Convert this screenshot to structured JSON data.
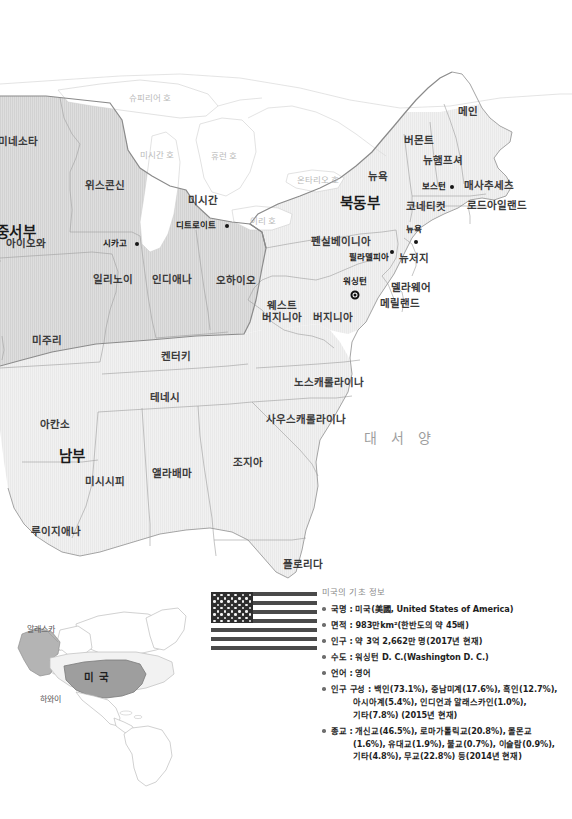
{
  "map": {
    "ocean_label": "대 서 양",
    "regions": [
      {
        "name": "중서부",
        "label": "중서부",
        "x": 8,
        "y": 232
      },
      {
        "name": "북동부",
        "label": "북동부",
        "x": 360,
        "y": 203
      },
      {
        "name": "남부",
        "label": "남부",
        "x": 72,
        "y": 456
      }
    ],
    "states": [
      {
        "name": "minnesota",
        "label": "미네소타",
        "x": 18,
        "y": 141
      },
      {
        "name": "wisconsin",
        "label": "위스콘신",
        "x": 105,
        "y": 185
      },
      {
        "name": "michigan",
        "label": "미시간",
        "x": 203,
        "y": 200
      },
      {
        "name": "iowa",
        "label": "아이오와",
        "x": 26,
        "y": 243
      },
      {
        "name": "illinois",
        "label": "일리노이",
        "x": 113,
        "y": 279
      },
      {
        "name": "indiana",
        "label": "인디애나",
        "x": 172,
        "y": 279
      },
      {
        "name": "ohio",
        "label": "오하이오",
        "x": 236,
        "y": 280
      },
      {
        "name": "missouri",
        "label": "미주리",
        "x": 47,
        "y": 340
      },
      {
        "name": "kentucky",
        "label": "켄터키",
        "x": 176,
        "y": 356
      },
      {
        "name": "tennessee",
        "label": "테네시",
        "x": 165,
        "y": 397
      },
      {
        "name": "arkansas",
        "label": "아칸소",
        "x": 55,
        "y": 424
      },
      {
        "name": "mississippi",
        "label": "미시시피",
        "x": 105,
        "y": 481
      },
      {
        "name": "alabama",
        "label": "앨라배마",
        "x": 172,
        "y": 473
      },
      {
        "name": "georgia",
        "label": "조지아",
        "x": 248,
        "y": 462
      },
      {
        "name": "louisiana",
        "label": "루이지애나",
        "x": 56,
        "y": 531
      },
      {
        "name": "florida",
        "label": "플로리다",
        "x": 303,
        "y": 564
      },
      {
        "name": "north-carolina",
        "label": "노스캐롤라이나",
        "x": 329,
        "y": 382
      },
      {
        "name": "south-carolina",
        "label": "사우스캐롤라이나",
        "x": 306,
        "y": 419
      },
      {
        "name": "virginia",
        "label": "버지니아",
        "x": 333,
        "y": 317
      },
      {
        "name": "west-virginia",
        "label": "웨스트\n버지니아",
        "x": 282,
        "y": 311
      },
      {
        "name": "pennsylvania",
        "label": "펜실베이니아",
        "x": 341,
        "y": 241
      },
      {
        "name": "new-york",
        "label": "뉴욕",
        "x": 378,
        "y": 176
      },
      {
        "name": "vermont",
        "label": "버몬트",
        "x": 419,
        "y": 140
      },
      {
        "name": "maine",
        "label": "메인",
        "x": 468,
        "y": 111
      },
      {
        "name": "new-hampshire",
        "label": "뉴햄프셔",
        "x": 443,
        "y": 160
      },
      {
        "name": "massachusetts",
        "label": "매사추세츠",
        "x": 489,
        "y": 185
      },
      {
        "name": "rhode-island",
        "label": "로드아일랜드",
        "x": 497,
        "y": 205
      },
      {
        "name": "connecticut",
        "label": "코네티컷",
        "x": 426,
        "y": 206
      },
      {
        "name": "new-jersey",
        "label": "뉴저지",
        "x": 414,
        "y": 258
      },
      {
        "name": "delaware",
        "label": "델라웨어",
        "x": 411,
        "y": 287
      },
      {
        "name": "maryland",
        "label": "메릴랜드",
        "x": 400,
        "y": 303
      }
    ],
    "cities": [
      {
        "name": "chicago",
        "label": "시카고",
        "lx": 115,
        "ly": 243,
        "dx": 137,
        "dy": 244
      },
      {
        "name": "detroit",
        "label": "디트로이트",
        "lx": 196,
        "ly": 225,
        "dx": 227,
        "dy": 226
      },
      {
        "name": "boston",
        "label": "보스턴",
        "lx": 434,
        "ly": 186,
        "dx": 452,
        "dy": 187
      },
      {
        "name": "new-york-city",
        "label": "뉴욕",
        "lx": 414,
        "ly": 229,
        "dx": 416,
        "dy": 242
      },
      {
        "name": "philadelphia",
        "label": "필라델피아",
        "lx": 369,
        "ly": 257,
        "dx": 392,
        "dy": 252
      }
    ],
    "capital": {
      "name": "washington-dc",
      "label": "워싱턴",
      "lx": 355,
      "ly": 281,
      "dx": 355,
      "dy": 295
    },
    "lakes": [
      {
        "name": "lake-superior",
        "label": "슈피리어 호",
        "x": 150,
        "y": 98
      },
      {
        "name": "lake-michigan",
        "label": "미시간 호",
        "x": 157,
        "y": 155
      },
      {
        "name": "lake-huron",
        "label": "휴런 호",
        "x": 224,
        "y": 156
      },
      {
        "name": "lake-ontario",
        "label": "온타리오 호",
        "x": 318,
        "y": 180
      },
      {
        "name": "lake-erie",
        "label": "이리 호",
        "x": 263,
        "y": 221
      }
    ]
  },
  "inset": {
    "alaska_label": "알래스카",
    "usa_label": "미 국",
    "hawaii_label": "하와이"
  },
  "flag": {
    "name": "us-flag",
    "stripes": 13,
    "stars": 50
  },
  "info": {
    "title": "미국의 기초 정보",
    "items": [
      {
        "name": "country-name",
        "text": "국명 : 미국(美國, United States of America)",
        "lines": []
      },
      {
        "name": "area",
        "text": "면적 : 983만km²(한반도의 약 45배)",
        "lines": []
      },
      {
        "name": "population",
        "text": "인구 : 약 3억 2,662만 명(2017년 현재)",
        "lines": []
      },
      {
        "name": "capital-city",
        "text": "수도 : 워싱턴 D. C.(Washington D. C.)",
        "lines": []
      },
      {
        "name": "language",
        "text": "언어 : 영어",
        "lines": []
      },
      {
        "name": "ethnic-composition",
        "text": "인구 구성 : 백인(73.1%), 중남미계(17.6%), 흑인(12.7%),",
        "lines": [
          "아시아계(5.4%), 인디언과 알래스카인(1.0%),",
          "기타(7.8%) (2015년 현재)"
        ]
      },
      {
        "name": "religion",
        "text": "종교 : 개신교(46.5%), 로마가톨릭교(20.8%), 몰몬교",
        "lines": [
          "(1.6%), 유대교(1.9%), 불교(0.7%), 이슬람(0.9%),",
          "기타(4.8%), 무교(22.8%) 등(2014년 현재)"
        ]
      }
    ]
  },
  "colors": {
    "land_light": "#f0f0f0",
    "land_mid": "#d9d9d9",
    "land_dark": "#c9c9c9",
    "border": "#9a9a9a",
    "water": "#ffffff",
    "text": "#2b2b2b"
  }
}
